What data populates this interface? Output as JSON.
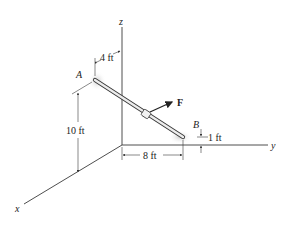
{
  "figure": {
    "axes": {
      "x": "x",
      "y": "y",
      "z": "z"
    },
    "points": {
      "A": "A",
      "B": "B"
    },
    "force": {
      "label": "F"
    },
    "dimensions": {
      "a_offset": "4 ft",
      "a_height": "10 ft",
      "b_distance": "8 ft",
      "b_height": "1 ft"
    },
    "colors": {
      "line": "#3a3a3a",
      "rod_fill": "#e8e8e8",
      "shadow": "#d0d0d0"
    }
  }
}
